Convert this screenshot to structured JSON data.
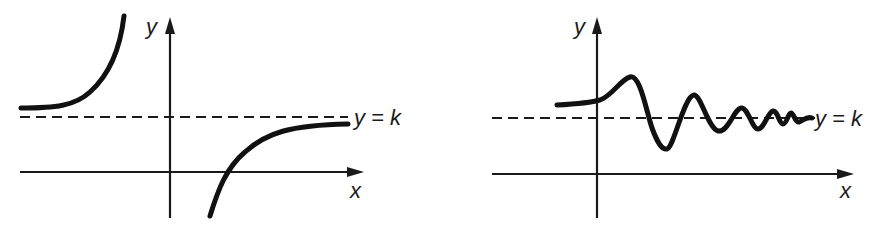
{
  "figure": {
    "type": "diagram",
    "colors": {
      "ink": "#111111",
      "background": "#ffffff"
    }
  },
  "panels": [
    {
      "id": "left",
      "axis_labels": {
        "x": "x",
        "y": "y"
      },
      "asymptote_label": "y = k",
      "curves": [
        {
          "name": "left-branch",
          "behavior": "approaches y = k from above as x → -∞, rises steeply toward the y-axis"
        },
        {
          "name": "right-branch",
          "behavior": "rises from below, crosses x-axis, approaches y = k from below as x → +∞"
        }
      ]
    },
    {
      "id": "right",
      "axis_labels": {
        "x": "x",
        "y": "y"
      },
      "asymptote_label": "y = k",
      "curves": [
        {
          "name": "damped-oscillation",
          "behavior": "oscillates about y = k with decreasing amplitude as x → +∞"
        }
      ]
    }
  ]
}
